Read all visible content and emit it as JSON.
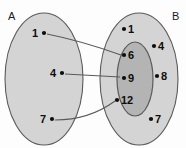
{
  "figure": {
    "type": "venn-mapping-diagram",
    "cropped_caption_fragment": "",
    "background_color": "#fdfdfd"
  },
  "colors": {
    "set_fill": "#d4d4d4",
    "subset_fill": "#b4b4b4",
    "outline": "#5a5a5a",
    "text": "#0d0d0d",
    "arrow": "#5a5a5a"
  },
  "sets": [
    {
      "id": "A",
      "label": "A",
      "label_x": 8,
      "label_y": 20,
      "ellipse": {
        "cx": 44,
        "cy": 79,
        "rx": 39,
        "ry": 66
      },
      "fill": "#d4d4d4"
    },
    {
      "id": "B",
      "label": "B",
      "label_x": 172,
      "label_y": 20,
      "ellipse": {
        "cx": 139,
        "cy": 79,
        "rx": 39,
        "ry": 66
      },
      "fill": "#d4d4d4"
    },
    {
      "id": "B-inner",
      "label": "",
      "label_x": 0,
      "label_y": 0,
      "ellipse": {
        "cx": 135,
        "cy": 79,
        "rx": 18,
        "ry": 37
      },
      "fill": "#b4b4b4"
    }
  ],
  "elements": {
    "domain": [
      {
        "label": "1",
        "text_x": 32,
        "text_y": 37,
        "dot_x": 44,
        "dot_y": 33
      },
      {
        "label": "4",
        "text_x": 50,
        "text_y": 77,
        "dot_x": 62,
        "dot_y": 73
      },
      {
        "label": "7",
        "text_x": 40,
        "text_y": 123,
        "dot_x": 52,
        "dot_y": 119
      }
    ],
    "codomain": [
      {
        "label": "1",
        "text_x": 128,
        "text_y": 33,
        "dot_x": 124,
        "dot_y": 29
      },
      {
        "label": "4",
        "text_x": 158,
        "text_y": 50,
        "dot_x": 154,
        "dot_y": 46
      },
      {
        "label": "6",
        "text_x": 128,
        "text_y": 59,
        "dot_x": 124,
        "dot_y": 55
      },
      {
        "label": "9",
        "text_x": 128,
        "text_y": 82,
        "dot_x": 124,
        "dot_y": 78
      },
      {
        "label": "12",
        "text_x": 121,
        "text_y": 104,
        "dot_x": 117,
        "dot_y": 100
      },
      {
        "label": "8",
        "text_x": 161,
        "text_y": 80,
        "dot_x": 157,
        "dot_y": 76
      },
      {
        "label": "7",
        "text_x": 155,
        "text_y": 123,
        "dot_x": 151,
        "dot_y": 119
      }
    ]
  },
  "mappings": [
    {
      "from": "1",
      "to": "6",
      "path": "M 47,34 C 72,39 96,46 121,55"
    },
    {
      "from": "4",
      "to": "9",
      "path": "M 65,74 L 120,77"
    },
    {
      "from": "7",
      "to": "12",
      "path": "M 55,120 C 80,120 100,112 115,101"
    }
  ]
}
